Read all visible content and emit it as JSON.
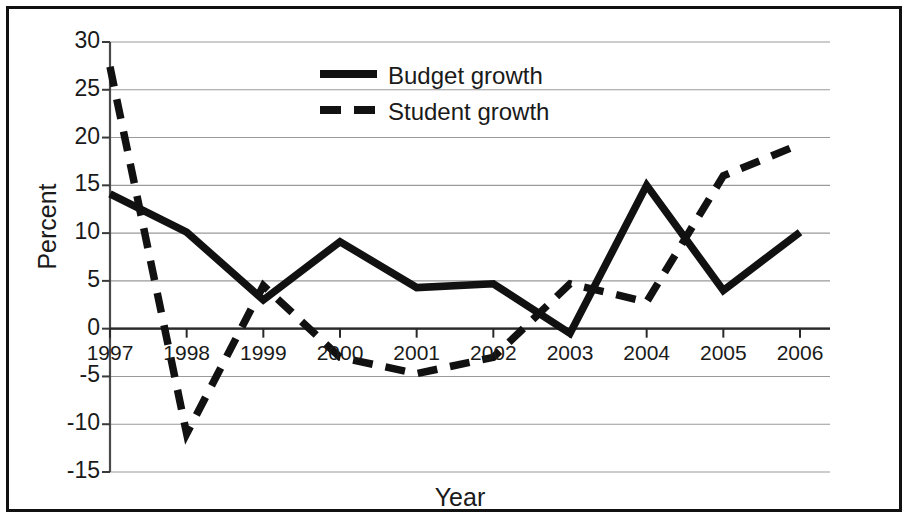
{
  "figure": {
    "border_color": "#111111",
    "background": "#ffffff",
    "line_color": "#111111",
    "gridline_color": "#9a9a9a"
  },
  "chart_data": {
    "type": "line",
    "title": "",
    "xlabel": "Year",
    "ylabel": "Percent",
    "categories": [
      "1997",
      "1998",
      "1999",
      "2000",
      "2001",
      "2002",
      "2003",
      "2004",
      "2005",
      "2006"
    ],
    "x": [
      1997,
      1998,
      1999,
      2000,
      2001,
      2002,
      2003,
      2004,
      2005,
      2006
    ],
    "series": [
      {
        "name": "Budget growth",
        "style": "solid",
        "values": [
          14.1,
          10.1,
          3.0,
          9.1,
          4.3,
          4.7,
          -0.5,
          15.0,
          4.0,
          10.1
        ]
      },
      {
        "name": "Student growth",
        "style": "dashed",
        "values": [
          27.4,
          -11.0,
          4.5,
          -3.0,
          -4.7,
          -3.0,
          4.7,
          2.8,
          16.0,
          19.3
        ]
      }
    ],
    "ylim": [
      -15,
      30
    ],
    "yticks": [
      30,
      25,
      20,
      15,
      10,
      5,
      0,
      -5,
      -10,
      -15
    ],
    "ytick_labels": [
      "30",
      "25",
      "20",
      "15",
      "10",
      "5",
      "0",
      "-5",
      "-10",
      "-15"
    ],
    "xlim": [
      1997,
      2006
    ],
    "grid": true,
    "grid_axis": "y",
    "legend_position": "upper-center"
  },
  "legend": {
    "entries": [
      {
        "label": "Budget growth",
        "style": "solid"
      },
      {
        "label": "Student growth",
        "style": "dashed"
      }
    ]
  }
}
